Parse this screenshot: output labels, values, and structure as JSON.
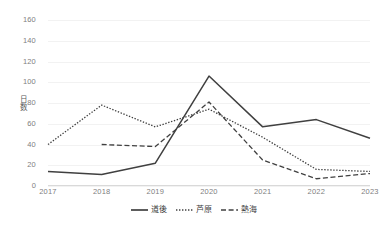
{
  "chart_data": {
    "type": "line",
    "title": "",
    "subtitle": "",
    "xlabel": "",
    "ylabel": "日数",
    "categories": [
      "2017",
      "2018",
      "2019",
      "2020",
      "2021",
      "2022",
      "2023"
    ],
    "x": [
      2017,
      2018,
      2019,
      2020,
      2021,
      2022,
      2023
    ],
    "ylim": [
      0,
      160
    ],
    "yticks": [
      0,
      20,
      40,
      60,
      80,
      100,
      120,
      140,
      160
    ],
    "ytick_labels": [
      "0",
      "20",
      "40",
      "60",
      "80",
      "100",
      "120",
      "140",
      "160"
    ],
    "grid": true,
    "grid_axis": "y",
    "legend_position": "bottom",
    "series": [
      {
        "name": "道後",
        "style": "solid",
        "color": "#404040",
        "values": [
          14,
          11,
          22,
          106,
          57,
          64,
          46
        ]
      },
      {
        "name": "芦原",
        "style": "dotted",
        "color": "#404040",
        "values": [
          40,
          78,
          57,
          74,
          47,
          16,
          14
        ]
      },
      {
        "name": "熱海",
        "style": "dashed",
        "color": "#404040",
        "values": [
          null,
          40,
          38,
          81,
          25,
          7,
          12
        ]
      }
    ]
  },
  "legend": {
    "items": [
      {
        "label": "道後",
        "style": "solid"
      },
      {
        "label": "芦原",
        "style": "dotted"
      },
      {
        "label": "熱海",
        "style": "dashed"
      }
    ]
  },
  "colors": {
    "series_line": "#404040",
    "gridline": "#f2f2f2",
    "axis": "#d9d9d9",
    "tick_text": "#808080",
    "axis_title_text": "#595959",
    "background": "#ffffff"
  }
}
